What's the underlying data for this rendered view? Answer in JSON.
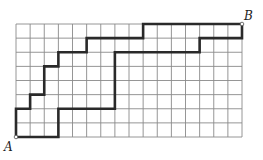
{
  "diagram": {
    "type": "lattice-paths",
    "grid": {
      "cols": 16,
      "rows": 8,
      "origin_px": [
        16,
        24
      ],
      "cell_w": 14.125,
      "cell_h": 14.125
    },
    "colors": {
      "grid": "#8a8a8a",
      "path": "#2a2a2a",
      "background": "#ffffff"
    },
    "points": {
      "A": {
        "label": "A",
        "col": 0,
        "row": 8
      },
      "B": {
        "label": "B",
        "col": 16,
        "row": 0
      }
    },
    "paths": [
      {
        "name": "upper-path",
        "vertices": [
          [
            0,
            8
          ],
          [
            0,
            6
          ],
          [
            1,
            6
          ],
          [
            1,
            5
          ],
          [
            2,
            5
          ],
          [
            2,
            3
          ],
          [
            3,
            3
          ],
          [
            3,
            2
          ],
          [
            5,
            2
          ],
          [
            5,
            1
          ],
          [
            9,
            1
          ],
          [
            9,
            0
          ],
          [
            16,
            0
          ]
        ]
      },
      {
        "name": "lower-path",
        "vertices": [
          [
            0,
            8
          ],
          [
            3,
            8
          ],
          [
            3,
            6
          ],
          [
            7,
            6
          ],
          [
            7,
            2
          ],
          [
            13,
            2
          ],
          [
            13,
            1
          ],
          [
            16,
            1
          ],
          [
            16,
            0
          ]
        ]
      }
    ]
  }
}
